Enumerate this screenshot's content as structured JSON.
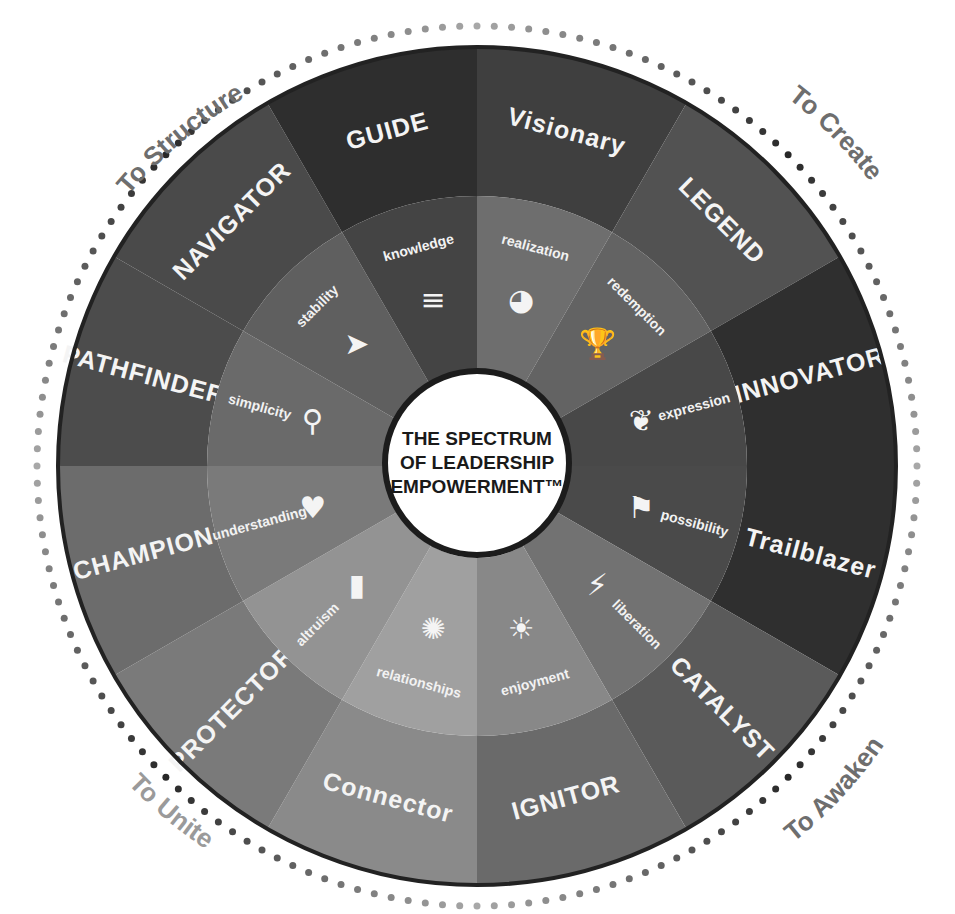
{
  "title": {
    "line1": "THE SPECTRUM",
    "line2": "OF LEADERSHIP",
    "line3": "EMPOWERMENT™"
  },
  "quadrants": [
    {
      "label": "To Structure",
      "position": "top-left"
    },
    {
      "label": "To Create",
      "position": "top-right"
    },
    {
      "label": "To Awaken",
      "position": "bottom-right"
    },
    {
      "label": "To Unite",
      "position": "bottom-left"
    }
  ],
  "outer_segments": [
    {
      "label": "Visionary",
      "color": "#3f3f3f"
    },
    {
      "label": "LEGEND",
      "color": "#525252"
    },
    {
      "label": "INNOVATOR",
      "color": "#2f2f2f"
    },
    {
      "label": "Trailblazer",
      "color": "#2f2f2f"
    },
    {
      "label": "CATALYST",
      "color": "#5a5a5a"
    },
    {
      "label": "IGNITOR",
      "color": "#6a6a6a"
    },
    {
      "label": "Connector",
      "color": "#8a8a8a"
    },
    {
      "label": "PROTECTOR",
      "color": "#7a7a7a"
    },
    {
      "label": "CHAMPION",
      "color": "#6c6c6c"
    },
    {
      "label": "PATHFINDER",
      "color": "#4c4c4c"
    },
    {
      "label": "NAVIGATOR",
      "color": "#4a4a4a"
    },
    {
      "label": "GUIDE",
      "color": "#2e2e2e"
    }
  ],
  "inner_segments": [
    {
      "label": "realization",
      "icon": "crystal-ball-icon",
      "color": "#6e6e6e"
    },
    {
      "label": "redemption",
      "icon": "trophy-icon",
      "color": "#636363"
    },
    {
      "label": "expression",
      "icon": "sprout-icon",
      "color": "#484848"
    },
    {
      "label": "possibility",
      "icon": "flag-icon",
      "color": "#4a4a4a"
    },
    {
      "label": "liberation",
      "icon": "lightning-icon",
      "color": "#727272"
    },
    {
      "label": "enjoyment",
      "icon": "sun-icon",
      "color": "#888888"
    },
    {
      "label": "relationships",
      "icon": "network-icon",
      "color": "#a0a0a0"
    },
    {
      "label": "altruism",
      "icon": "bookmark-icon",
      "color": "#939393"
    },
    {
      "label": "understanding",
      "icon": "heart-icon",
      "color": "#7a7a7a"
    },
    {
      "label": "simplicity",
      "icon": "path-icon",
      "color": "#6a6a6a"
    },
    {
      "label": "stability",
      "icon": "compass-icon",
      "color": "#5f5f5f"
    },
    {
      "label": "knowledge",
      "icon": "text-lines-icon",
      "color": "#444444"
    }
  ]
}
